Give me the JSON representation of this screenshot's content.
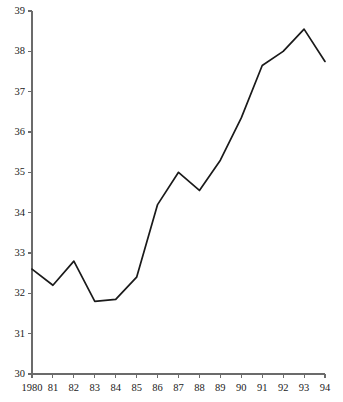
{
  "chart_data": {
    "type": "line",
    "title": "",
    "subtitle": "",
    "xlabel": "",
    "ylabel": "",
    "x": [
      1980,
      1981,
      1982,
      1983,
      1984,
      1985,
      1986,
      1987,
      1988,
      1989,
      1990,
      1991,
      1992,
      1993,
      1994
    ],
    "categories": [
      "1980",
      "81",
      "82",
      "83",
      "84",
      "85",
      "86",
      "87",
      "88",
      "89",
      "90",
      "91",
      "92",
      "93",
      "94"
    ],
    "values": [
      32.6,
      32.2,
      32.8,
      31.8,
      31.85,
      32.4,
      34.2,
      35.0,
      34.55,
      35.3,
      36.35,
      37.65,
      38.0,
      38.55,
      37.75
    ],
    "series": [
      {
        "name": "series-1",
        "values": [
          32.6,
          32.2,
          32.8,
          31.8,
          31.85,
          32.4,
          34.2,
          35.0,
          34.55,
          35.3,
          36.35,
          37.65,
          38.0,
          38.55,
          37.75
        ],
        "color": "#1a1a1a"
      }
    ],
    "xlim": [
      1980,
      1994
    ],
    "ylim": [
      30,
      39
    ],
    "yticks": [
      30,
      31,
      32,
      33,
      34,
      35,
      36,
      37,
      38,
      39
    ],
    "ytick_labels": [
      "30",
      "31",
      "32",
      "33",
      "34",
      "35",
      "36",
      "37",
      "38",
      "39"
    ],
    "xticks": [
      1980,
      1981,
      1982,
      1983,
      1984,
      1985,
      1986,
      1987,
      1988,
      1989,
      1990,
      1991,
      1992,
      1993,
      1994
    ],
    "xtick_labels": [
      "1980",
      "81",
      "82",
      "83",
      "84",
      "85",
      "86",
      "87",
      "88",
      "89",
      "90",
      "91",
      "92",
      "93",
      "94"
    ],
    "grid": false,
    "legend": false,
    "legend_position": "none",
    "markers": false,
    "line_color": "#1a1a1a",
    "axis_color": "#6b6b6b"
  },
  "plot_geometry": {
    "left": 32,
    "right": 325,
    "top": 11,
    "bottom": 374
  }
}
